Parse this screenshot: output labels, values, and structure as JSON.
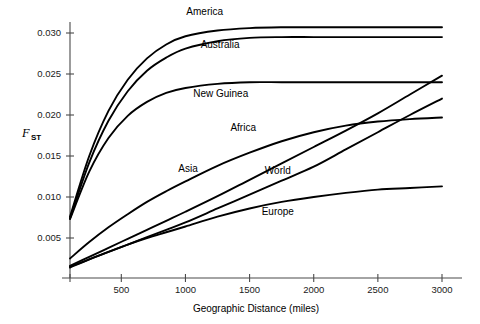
{
  "chart_data": {
    "type": "line",
    "title": "",
    "xlabel": "Geographic Distance (miles)",
    "ylabel": "F_ST",
    "ylabel_main": "F",
    "ylabel_sub": "ST",
    "xlim": [
      100,
      3050
    ],
    "ylim": [
      0.0,
      0.0325
    ],
    "xticks": [
      500,
      1000,
      1500,
      2000,
      2500,
      3000
    ],
    "xtick_labels": [
      "500",
      "1000",
      "1500",
      "2000",
      "2500",
      "3000"
    ],
    "yticks": [
      0.005,
      0.01,
      0.015,
      0.02,
      0.025,
      0.03
    ],
    "ytick_labels": [
      "0.005",
      "0.010",
      "0.015",
      "0.020",
      "0.025",
      "0.030"
    ],
    "grid": false,
    "legend_position": "inline-labels",
    "line_color": "#000000",
    "axis_color": "#4a4a4a",
    "background_color": "#ffffff",
    "x": [
      100,
      250,
      400,
      550,
      700,
      850,
      1000,
      1250,
      1500,
      1750,
      2000,
      2250,
      2500,
      2750,
      3000
    ],
    "series": [
      {
        "name": "America",
        "label": "America",
        "label_x": 1150,
        "label_y": 0.0322,
        "values": [
          0.0076,
          0.015,
          0.0205,
          0.0243,
          0.0269,
          0.0286,
          0.0296,
          0.0303,
          0.0306,
          0.0307,
          0.0307,
          0.0307,
          0.0307,
          0.0307,
          0.0307
        ]
      },
      {
        "name": "Australia",
        "label": "Australia",
        "label_x": 1270,
        "label_y": 0.0282,
        "values": [
          0.0074,
          0.0142,
          0.0193,
          0.0229,
          0.0254,
          0.027,
          0.0281,
          0.029,
          0.0294,
          0.0295,
          0.0295,
          0.0295,
          0.0295,
          0.0295,
          0.0295
        ]
      },
      {
        "name": "New Guinea",
        "label": "New Guinea",
        "label_x": 1275,
        "label_y": 0.0222,
        "values": [
          0.0073,
          0.0131,
          0.0172,
          0.0199,
          0.0216,
          0.0227,
          0.0233,
          0.0238,
          0.024,
          0.024,
          0.024,
          0.024,
          0.024,
          0.024,
          0.024
        ]
      },
      {
        "name": "Africa",
        "label": "Africa",
        "label_x": 1450,
        "label_y": 0.0181,
        "values": [
          0.0025,
          0.0045,
          0.0063,
          0.0079,
          0.0094,
          0.0107,
          0.0119,
          0.0138,
          0.0154,
          0.0168,
          0.0179,
          0.0187,
          0.0192,
          0.0195,
          0.0197
        ]
      },
      {
        "name": "Asia",
        "label": "Asia",
        "label_x": 1020,
        "label_y": 0.013,
        "values": [
          0.0016,
          0.0027,
          0.0038,
          0.0049,
          0.006,
          0.0071,
          0.0082,
          0.0101,
          0.0121,
          0.0141,
          0.0161,
          0.0181,
          0.0202,
          0.0225,
          0.0248
        ]
      },
      {
        "name": "World",
        "label": "World",
        "label_x": 1720,
        "label_y": 0.0128,
        "values": [
          0.0015,
          0.0024,
          0.0033,
          0.0042,
          0.0051,
          0.006,
          0.0069,
          0.0086,
          0.0103,
          0.012,
          0.0137,
          0.0158,
          0.0179,
          0.02,
          0.022
        ]
      },
      {
        "name": "Europe",
        "label": "Europe",
        "label_x": 1720,
        "label_y": 0.0078,
        "values": [
          0.0014,
          0.0024,
          0.0033,
          0.0042,
          0.005,
          0.0057,
          0.0064,
          0.0076,
          0.0086,
          0.0094,
          0.01,
          0.0105,
          0.0109,
          0.0111,
          0.0113
        ]
      }
    ]
  }
}
